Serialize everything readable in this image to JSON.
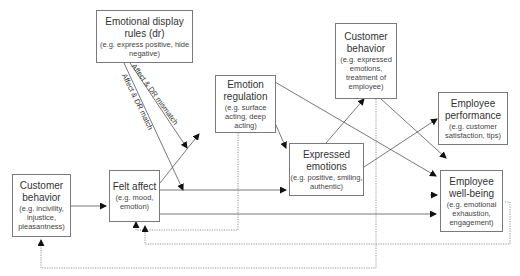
{
  "nodes": {
    "display_rules": {
      "title": "Emotional display rules (dr)",
      "sub": "(e.g. express positive, hide negative)"
    },
    "emotion_regulation": {
      "title": "Emotion regulation",
      "sub": "(e.g. surface acting, deep acting)"
    },
    "customer_behavior_top": {
      "title": "Customer behavior",
      "sub": "(e.g. expressed emotions, treatment of employee)"
    },
    "employee_performance": {
      "title": "Employee performance",
      "sub": "(e.g. customer satisfaction, tips)"
    },
    "expressed_emotions": {
      "title": "Expressed emotions",
      "sub": "(e.g. positive, smiling, authentic)"
    },
    "employee_wellbeing": {
      "title": "Employee well-being",
      "sub": "(e.g. emotional exhaustion, engagement)"
    },
    "customer_behavior_left": {
      "title": "Customer behavior",
      "sub": "(e.g. incivility, injustice, pleasantness)"
    },
    "felt_affect": {
      "title": "Felt affect",
      "sub": "(e.g. mood, emotion)"
    }
  },
  "edge_labels": {
    "mismatch": "Affect & DR mismatch",
    "match": "Affect & DR match"
  },
  "colors": {
    "line": "#555555",
    "border": "#7a7a7a"
  }
}
